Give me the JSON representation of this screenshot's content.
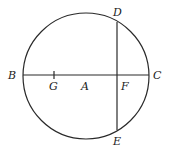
{
  "diagram": {
    "type": "circle-geometry",
    "stroke_color": "#2a2a2a",
    "background": "#ffffff",
    "circle": {
      "center_label": "A",
      "cx": 86,
      "cy": 76,
      "r": 63
    },
    "points": {
      "B": {
        "label": "B",
        "x": 23,
        "y": 75
      },
      "C": {
        "label": "C",
        "x": 149,
        "y": 75
      },
      "D": {
        "label": "D",
        "x": 117,
        "y": 22
      },
      "E": {
        "label": "E",
        "x": 117,
        "y": 130
      },
      "F": {
        "label": "F",
        "x": 117,
        "y": 75
      },
      "G": {
        "label": "G",
        "x": 54,
        "y": 75
      },
      "A": {
        "label": "A",
        "x": 86,
        "y": 75
      }
    },
    "segments": [
      {
        "name": "BC",
        "from": "B",
        "to": "C"
      },
      {
        "name": "DE",
        "from": "D",
        "to": "E"
      }
    ]
  }
}
